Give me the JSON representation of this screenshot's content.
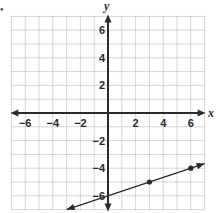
{
  "chart_data": {
    "type": "line",
    "title": "",
    "xlabel": "x",
    "ylabel": "y",
    "xlim": [
      -7,
      7
    ],
    "ylim": [
      -7,
      7
    ],
    "grid": true,
    "grid_step": 1,
    "x_ticks": [
      -6,
      -4,
      -2,
      2,
      4,
      6
    ],
    "y_ticks": [
      6,
      4,
      2,
      -2,
      -4,
      -6
    ],
    "x_tick_labels": [
      "−6",
      "−4",
      "−2",
      "2",
      "4",
      "6"
    ],
    "y_tick_labels": [
      "6",
      "4",
      "2",
      "−2",
      "−4",
      "−6"
    ],
    "series": [
      {
        "name": "line",
        "equation": "y = (1/3)x - 6",
        "slope": 0.3333,
        "intercept": -6,
        "x_range": [
          -3,
          7
        ],
        "arrows": "both",
        "points": [
          {
            "x": 0,
            "y": -6
          },
          {
            "x": 3,
            "y": -5
          },
          {
            "x": 6,
            "y": -4
          }
        ],
        "marked_points": [
          {
            "x": 3,
            "y": -5
          },
          {
            "x": 6,
            "y": -4
          }
        ]
      }
    ]
  },
  "colors": {
    "axis": "#2a2a2a",
    "grid": "#9a9a9a",
    "line": "#2a2a2a",
    "text": "#2a2a2a"
  },
  "question_marker": "•"
}
